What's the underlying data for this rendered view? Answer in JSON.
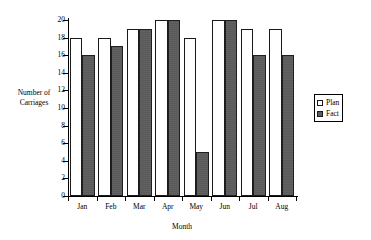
{
  "chart_data": {
    "type": "bar",
    "title": "",
    "subtitle": "",
    "xlabel": "Month",
    "ylabel": "Number of Carriages",
    "ylabel_line1": "Number of",
    "ylabel_line2": "Carriages",
    "categories": [
      "Jan",
      "Feb",
      "Mar",
      "Apr",
      "May",
      "Jun",
      "Jul",
      "Aug"
    ],
    "series": [
      {
        "name": "Plan",
        "values": [
          18,
          18,
          19,
          20,
          18,
          20,
          19,
          19
        ],
        "color": "#ffffff"
      },
      {
        "name": "Fact",
        "values": [
          16,
          17,
          19,
          20,
          5,
          20,
          16,
          16
        ],
        "color": "#5a5a5a"
      }
    ],
    "ylim": [
      0,
      20
    ],
    "ytick_values": [
      0,
      2,
      4,
      6,
      8,
      10,
      12,
      14,
      16,
      18,
      20
    ],
    "ytick_labels": [
      "0",
      "2",
      "4",
      "6",
      "8",
      "10",
      "12",
      "14",
      "16",
      "18",
      "20"
    ],
    "grid": false,
    "legend_position": "right",
    "legend_entries": [
      "Plan",
      "Fact"
    ],
    "axis_color": "#000000",
    "background": "#ffffff"
  }
}
